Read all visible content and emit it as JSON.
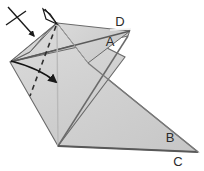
{
  "figure": {
    "background_color": "#ffffff",
    "paper_fill_light": "#d8d8d8",
    "paper_fill_mid": "#cfcfcf",
    "paper_fill_dark": "#c4c4c4",
    "outline_color": "#4a4a4a",
    "crease_color": "#5a5a5a",
    "dashed_fold_color": "#2f2f2f",
    "arrow_color": "#1a1a1a",
    "label_color": "#2b2b2b"
  },
  "labels": [
    {
      "id": "label-d",
      "text": "D",
      "x": 120,
      "y": 26
    },
    {
      "id": "label-a",
      "text": "A",
      "x": 110,
      "y": 46
    },
    {
      "id": "label-b",
      "text": "B",
      "x": 170,
      "y": 142
    },
    {
      "id": "label-c",
      "text": "C",
      "x": 178,
      "y": 166
    }
  ],
  "annotations": {
    "push_arrow": "push-arrow-icon",
    "cancelled_arrow": "cancelled-arrow-icon",
    "fold_arrow": "curved-fold-arrow-icon",
    "valley_fold": "dashed-fold-line"
  },
  "geometry": {
    "apex": {
      "x": 57,
      "y": 23
    },
    "left_point": {
      "x": 10,
      "y": 62
    },
    "bottom_vertex": {
      "x": 58,
      "y": 146
    },
    "right_tip_upper": {
      "x": 130,
      "y": 32
    },
    "right_tip_lower": {
      "x": 198,
      "y": 152
    }
  }
}
